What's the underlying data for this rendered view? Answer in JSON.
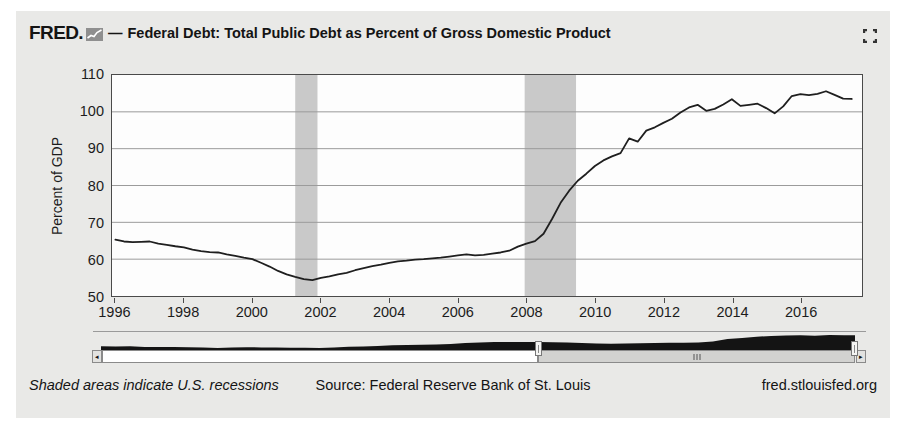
{
  "header": {
    "logo_text": "FRED.",
    "separator": "—",
    "title": "Federal Debt: Total Public Debt as Percent of Gross Domestic Product"
  },
  "footer": {
    "note": "Shaded areas indicate U.S. recessions",
    "source": "Source: Federal Reserve Bank of St. Louis",
    "site": "fred.stlouisfed.org"
  },
  "icons": {
    "logo_graph": "fred-graph-icon",
    "fullscreen": "fullscreen-icon",
    "scroll_left": "◂",
    "scroll_right": "▸"
  },
  "colors": {
    "widget_bg": "#e9e9e7",
    "plot_bg": "#fdfdfd",
    "line": "#1f1f1f",
    "grid": "#9a9a9a",
    "recession": "#c9c9c9",
    "axis": "#4a4a4a",
    "mini_fill": "#141414"
  },
  "chart_data": {
    "type": "line",
    "title": "Federal Debt: Total Public Debt as Percent of Gross Domestic Product",
    "xlabel": "",
    "ylabel": "Percent of GDP",
    "ylim": [
      50,
      110
    ],
    "yticks": [
      50,
      60,
      70,
      80,
      90,
      100,
      110
    ],
    "xlim": [
      1995.9,
      2017.8
    ],
    "xticks": [
      1996,
      1998,
      2000,
      2002,
      2004,
      2006,
      2008,
      2010,
      2012,
      2014,
      2016
    ],
    "grid": true,
    "legend": "none",
    "recession_bands": [
      {
        "start": 2001.25,
        "end": 2001.9
      },
      {
        "start": 2007.95,
        "end": 2009.45
      }
    ],
    "series": [
      {
        "name": "Federal Debt: Total Public Debt as Percent of GDP",
        "x_start": 1996.0,
        "x_step": 0.25,
        "values": [
          65.3,
          64.8,
          64.6,
          64.7,
          64.8,
          64.2,
          63.9,
          63.5,
          63.2,
          62.6,
          62.2,
          61.9,
          61.8,
          61.3,
          60.9,
          60.4,
          60.0,
          59.0,
          58.0,
          56.8,
          55.9,
          55.2,
          54.6,
          54.3,
          54.9,
          55.3,
          55.9,
          56.3,
          57.0,
          57.6,
          58.1,
          58.5,
          59.0,
          59.4,
          59.6,
          59.9,
          60.0,
          60.2,
          60.4,
          60.7,
          61.0,
          61.3,
          61.0,
          61.2,
          61.5,
          61.8,
          62.3,
          63.4,
          64.2,
          64.9,
          66.9,
          70.9,
          75.3,
          78.6,
          81.3,
          83.2,
          85.3,
          86.8,
          87.9,
          88.8,
          92.8,
          91.9,
          94.9,
          95.8,
          97.0,
          98.1,
          99.8,
          101.2,
          101.9,
          100.3,
          100.8,
          102.0,
          103.4,
          101.6,
          101.9,
          102.2,
          101.0,
          99.6,
          101.5,
          104.3,
          104.8,
          104.5,
          104.9,
          105.6,
          104.6,
          103.6,
          103.5
        ]
      }
    ]
  },
  "slider": {
    "range": [
      1966,
      2017.75
    ],
    "selection": [
      1996,
      2017.75
    ],
    "preview": {
      "x_start": 1966,
      "x_step": 1,
      "values": [
        40.9,
        40.4,
        40.8,
        37.3,
        36.4,
        36.4,
        35.4,
        34.1,
        31.8,
        33.6,
        35.0,
        34.8,
        34.0,
        32.3,
        32.5,
        31.8,
        34.8,
        38.7,
        39.6,
        42.6,
        46.3,
        48.1,
        49.6,
        50.6,
        54.2,
        58.8,
        62.3,
        64.4,
        64.8,
        65.4,
        65.0,
        63.8,
        61.8,
        60.0,
        57.0,
        54.8,
        56.1,
        58.1,
        59.5,
        60.4,
        61.1,
        62.0,
        67.0,
        82.0,
        87.5,
        94.5,
        99.5,
        101.0,
        102.5,
        100.5,
        105.0,
        103.5
      ]
    }
  }
}
